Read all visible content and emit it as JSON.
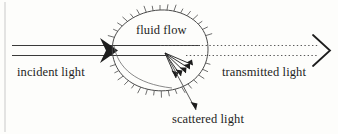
{
  "figure": {
    "kind": "optical-scattering-diagram",
    "background_color": "#fdfdfb",
    "ink_color": "#1d1d1d",
    "labels": {
      "incident_light": "incident light",
      "transmitted_light": "transmitted light",
      "fluid_flow": "fluid flow",
      "scattered_light": "scattered light"
    },
    "elements": {
      "incident_beam": {
        "name": "incident light beam",
        "style": "two solid parallel horizontal lines with solid filled arrowhead",
        "y_top": 45,
        "y_bottom": 55,
        "x_start": 12,
        "x_end": 113
      },
      "transmitted_beam": {
        "name": "transmitted light beam",
        "style": "two dotted parallel horizontal lines with open chevron arrowhead",
        "y_top": 45,
        "y_bottom": 55,
        "x_start": 205,
        "x_end": 325
      },
      "scattering_volume": {
        "name": "fluid flow blob",
        "style": "irregular closed oval outline with outward hatch marks",
        "hatch_count": 40
      },
      "scattered_rays": {
        "name": "scattered light ray fan",
        "style": "fan of five short solid arrows radiating down-right from scattering point",
        "origin_x": 165,
        "origin_y": 53,
        "ray_count": 5
      },
      "scattered_leader": {
        "name": "leader line from scattering point to scattered light label",
        "style": "thin solid line with small arrowhead"
      },
      "page_edge": {
        "name": "scanned page edge rule",
        "x": 5
      }
    }
  }
}
